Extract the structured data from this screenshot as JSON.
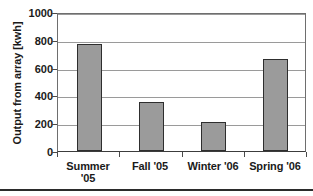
{
  "chart_data": {
    "type": "bar",
    "title": "",
    "xlabel": "",
    "ylabel": "Output from array [kwh]",
    "categories": [
      "Summer '05",
      "Fall '05",
      "Winter '06",
      "Spring '06"
    ],
    "category_lines": [
      [
        "Summer",
        "'05"
      ],
      [
        "Fall '05"
      ],
      [
        "Winter '06"
      ],
      [
        "Spring '06"
      ]
    ],
    "values": [
      770,
      350,
      210,
      660
    ],
    "ylim": [
      0,
      1000
    ],
    "yticks": [
      0,
      200,
      400,
      600,
      800,
      1000
    ],
    "ytick_labels": [
      "0",
      "200",
      "400",
      "600",
      "800",
      "1000"
    ],
    "grid": true,
    "legend": false,
    "series": [
      {
        "name": "Output from array [kwh]",
        "values": [
          770,
          350,
          210,
          660
        ]
      }
    ],
    "colors": {
      "bar_fill": "#9b9b9b",
      "bar_border": "#2e2e2e",
      "gridline": "#9a9a9a",
      "axis": "#4a4a4a",
      "text": "#1a1a1a",
      "background": "#ffffff"
    }
  }
}
